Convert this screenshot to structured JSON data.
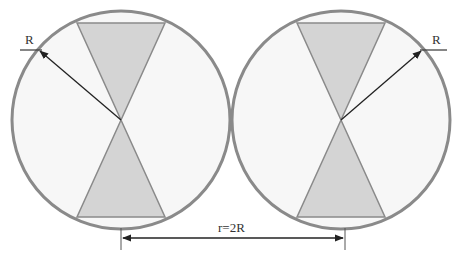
{
  "diagram": {
    "title": "",
    "labels": {
      "left_radius": "R",
      "right_radius": "R",
      "distance": "r=2R"
    },
    "shapes": {
      "circle_count": 2,
      "description": "Two tangent circles of radius R, each containing a bowtie (two opposing triangles meeting at the center); a dimension arrow between centers labeled r=2R"
    },
    "colors": {
      "circle_stroke": "#8a8a8a",
      "circle_fill": "#f7f7f7",
      "triangle_fill": "#d4d4d4",
      "arrow": "#222222"
    }
  }
}
